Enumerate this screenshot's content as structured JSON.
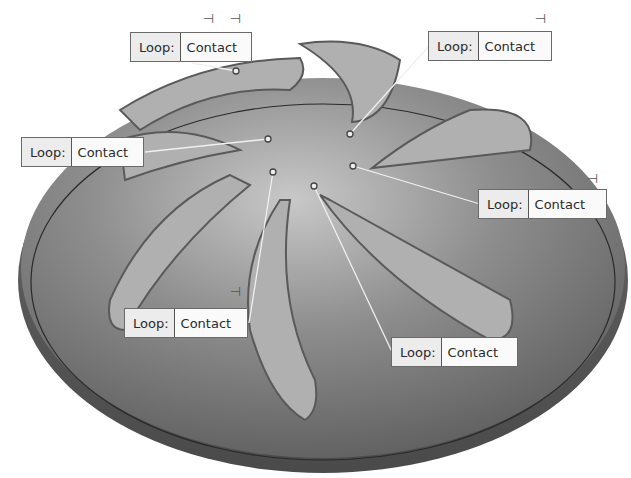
{
  "viewport": {
    "background": "#ffffff",
    "model": "domed-disc-with-seven-curved-slots",
    "colors": {
      "surface": "#8a8a8a",
      "slot_floor": "#b4b4b4",
      "rim_line": "#333333"
    }
  },
  "callouts": [
    {
      "key": "Loop:",
      "value": "Contact",
      "x": 130,
      "y": 32,
      "w": 122,
      "anchor": [
        192,
        63
      ],
      "target": [
        236,
        71
      ]
    },
    {
      "key": "Loop:",
      "value": "Contact",
      "x": 428,
      "y": 31,
      "w": 124,
      "anchor": [
        429,
        46
      ],
      "target": [
        350,
        134
      ]
    },
    {
      "key": "Loop:",
      "value": "Contact",
      "x": 21,
      "y": 137,
      "w": 123,
      "anchor": [
        145,
        152
      ],
      "target": [
        268,
        139
      ]
    },
    {
      "key": "Loop:",
      "value": "Contact",
      "x": 478,
      "y": 189,
      "w": 129,
      "anchor": [
        480,
        204
      ],
      "target": [
        353,
        166
      ]
    },
    {
      "key": "Loop:",
      "value": "Contact",
      "x": 124,
      "y": 308,
      "w": 124,
      "anchor": [
        249,
        323
      ],
      "target": [
        273,
        172
      ]
    },
    {
      "key": "Loop:",
      "value": "Contact",
      "x": 391,
      "y": 337,
      "w": 127,
      "anchor": [
        393,
        354
      ],
      "target": [
        314,
        186
      ]
    }
  ],
  "pins": [
    {
      "glyph": "⊣",
      "x": 203,
      "y": 12
    },
    {
      "glyph": "⊣",
      "x": 230,
      "y": 12
    },
    {
      "glyph": "⊣",
      "x": 535,
      "y": 12
    },
    {
      "glyph": "⊣",
      "x": 230,
      "y": 285
    },
    {
      "glyph": "⊣",
      "x": 587,
      "y": 172
    }
  ]
}
